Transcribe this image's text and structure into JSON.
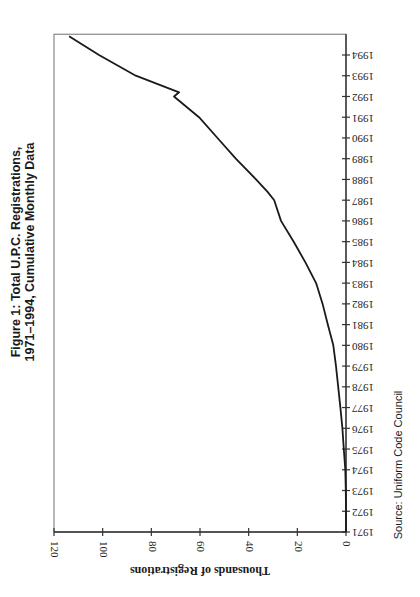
{
  "figure": {
    "title_line1": "Figure 1: Total U.P.C. Registrations,",
    "title_line2": "1971–1994, Cumulative Monthly Data",
    "source": "Source: Uniform Code Council",
    "orientation": "rotated 90 degrees clockwise"
  },
  "colors": {
    "line": "#1a1a1a",
    "axis": "#333333",
    "frame": "#888888",
    "background": "#ffffff"
  },
  "chart_data": {
    "type": "line",
    "title": "Figure 1: Total U.P.C. Registrations, 1971–1994, Cumulative Monthly Data",
    "xlabel": "",
    "ylabel": "Thousands of Registrations",
    "xlim": [
      1971,
      1995
    ],
    "ylim": [
      0,
      120
    ],
    "x_ticks": [
      "1971",
      "1972",
      "1973",
      "1974",
      "1975",
      "1976",
      "1977",
      "1978",
      "1979",
      "1980",
      "1981",
      "1982",
      "1983",
      "1984",
      "1985",
      "1986",
      "1987",
      "1988",
      "1989",
      "1990",
      "1991",
      "1992",
      "1993",
      "1994"
    ],
    "y_ticks": [
      "0",
      "20",
      "40",
      "60",
      "80",
      "100",
      "120"
    ],
    "grid": false,
    "legend": null,
    "source": "Source: Uniform Code Council",
    "series": [
      {
        "name": "Cumulative U.P.C. registrations (thousands)",
        "x": [
          1971,
          1972,
          1973,
          1974,
          1975,
          1976,
          1977,
          1978,
          1979,
          1980,
          1981,
          1982,
          1983,
          1984,
          1985,
          1986,
          1987,
          1987.4,
          1988,
          1989,
          1990,
          1991,
          1992,
          1992.2,
          1993,
          1994,
          1994.9
        ],
        "values": [
          0,
          0,
          0.1,
          0.3,
          0.9,
          1.5,
          2.3,
          3.2,
          4.1,
          5.2,
          7.5,
          9.6,
          12.3,
          16.7,
          21.5,
          26.7,
          29.5,
          32.2,
          37.0,
          45.3,
          52.8,
          60.4,
          70.7,
          68.6,
          86.4,
          101.5,
          113.8
        ]
      }
    ]
  }
}
